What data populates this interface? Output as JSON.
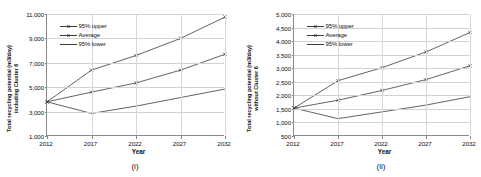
{
  "figure": {
    "panels": [
      {
        "key": "panel_i",
        "label": "(i)",
        "ytitle_line1": "Total recycling potential (m3/day)",
        "ytitle_line2": "including Cluster 6",
        "xtitle": "Year",
        "legend": [
          "95% upper",
          "Average",
          "95% lower"
        ]
      },
      {
        "key": "panel_ii",
        "label": "(ii)",
        "ytitle_line1": "Total recycling potential (m3/day)",
        "ytitle_line2": "without Cluster 6",
        "xtitle": "Year",
        "legend": [
          "95% upper",
          "Average",
          "95% lower"
        ]
      }
    ],
    "line_color": "#3b3b3b",
    "grid_color": "#d2d2d2",
    "axis_color": "#8a8a8a"
  },
  "chart_data": [
    {
      "type": "line",
      "panel": "(i)",
      "title": "",
      "xlabel": "Year",
      "ylabel": "Total recycling potential (m3/day) including Cluster 6",
      "categories": [
        "2012",
        "2017",
        "2022",
        "2027",
        "2032"
      ],
      "x": [
        2012,
        2017,
        2022,
        2027,
        2032
      ],
      "ylim": [
        1000,
        11000
      ],
      "yticks": [
        "1,000",
        "3,000",
        "5,000",
        "7,000",
        "9,000",
        "11,000"
      ],
      "ytick_values": [
        1000,
        3000,
        5000,
        7000,
        9000,
        11000
      ],
      "grid": true,
      "legend_position": "upper left",
      "series": [
        {
          "name": "95% upper",
          "values": [
            3800,
            6400,
            7600,
            9000,
            10750
          ]
        },
        {
          "name": "Average",
          "values": [
            3800,
            4600,
            5350,
            6400,
            7700
          ]
        },
        {
          "name": "95% lower",
          "values": [
            3800,
            2850,
            3450,
            4150,
            4850
          ]
        }
      ]
    },
    {
      "type": "line",
      "panel": "(ii)",
      "title": "",
      "xlabel": "Year",
      "ylabel": "Total recycling potential (m3/day) without Cluster 6",
      "categories": [
        "2012",
        "2017",
        "2022",
        "2027",
        "2032"
      ],
      "x": [
        2012,
        2017,
        2022,
        2027,
        2032
      ],
      "ylim": [
        500,
        5000
      ],
      "yticks": [
        "500",
        "1,000",
        "1,500",
        "2,000",
        "2,500",
        "3,000",
        "3,500",
        "4,000",
        "4,500",
        "5,000"
      ],
      "ytick_values": [
        500,
        1000,
        1500,
        2000,
        2500,
        3000,
        3500,
        4000,
        4500,
        5000
      ],
      "grid": true,
      "legend_position": "upper left",
      "series": [
        {
          "name": "95% upper",
          "values": [
            1530,
            2540,
            3020,
            3600,
            4320
          ]
        },
        {
          "name": "Average",
          "values": [
            1530,
            1820,
            2180,
            2580,
            3090
          ]
        },
        {
          "name": "95% lower",
          "values": [
            1530,
            1140,
            1390,
            1640,
            1950
          ]
        }
      ]
    }
  ]
}
